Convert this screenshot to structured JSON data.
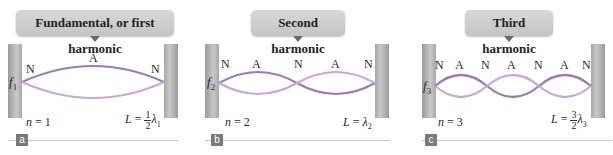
{
  "panels": [
    {
      "id": "a",
      "title": "Fundamental, or first harmonic",
      "freq_symbol": "f",
      "freq_sub": "1",
      "node_labels": [
        "N",
        "A",
        "N"
      ],
      "n_label": "n",
      "n_eq": " = 1",
      "L_label": "L",
      "L_eq": " = ",
      "L_frac_num": "1",
      "L_frac_den": "2",
      "L_lambda": "λ",
      "L_lambda_sub": "1",
      "badge": "a"
    },
    {
      "id": "b",
      "title": "Second harmonic",
      "freq_symbol": "f",
      "freq_sub": "2",
      "node_labels": [
        "N",
        "A",
        "N",
        "A",
        "N"
      ],
      "n_label": "n",
      "n_eq": " = 2",
      "L_label": "L",
      "L_eq": " = ",
      "L_lambda": "λ",
      "L_lambda_sub": "2",
      "badge": "b"
    },
    {
      "id": "c",
      "title": "Third harmonic",
      "freq_symbol": "f",
      "freq_sub": "3",
      "node_labels": [
        "N",
        "A",
        "N",
        "A",
        "N",
        "A",
        "N"
      ],
      "n_label": "n",
      "n_eq": " = 3",
      "L_label": "L",
      "L_eq": " = ",
      "L_frac_num": "3",
      "L_frac_den": "2",
      "L_lambda": "λ",
      "L_lambda_sub": "3",
      "badge": "c"
    }
  ],
  "colors": {
    "wave_dark": "#9b7bb0",
    "wave_light": "#c9a8d6",
    "wall": "#b0b0b0",
    "callout": "#cfcfcf",
    "badge": "#7a7a7a"
  }
}
